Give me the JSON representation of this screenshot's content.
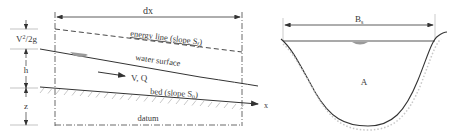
{
  "diagram": {
    "profile": {
      "dx_label": "dx",
      "energy_line_label": "energy line (slope S",
      "energy_line_subscript": "f",
      "energy_line_close": ")",
      "water_surface_label": "water surface",
      "flow_label": "V, Q",
      "bed_label": "bed (slope S",
      "bed_subscript": "0",
      "bed_close": ")",
      "datum_label": "datum",
      "x_axis_label": "x",
      "dims": {
        "velocity_head": "V",
        "velocity_head_sup": "2",
        "velocity_head_rest": "/2g",
        "depth": "h",
        "elevation": "z"
      }
    },
    "cross_section": {
      "width_label": "B",
      "width_subscript": "s",
      "area_label": "A"
    },
    "colors": {
      "line": "#333333",
      "hatch": "#b0b0b0",
      "water_marker": "#9a9a9a"
    }
  }
}
